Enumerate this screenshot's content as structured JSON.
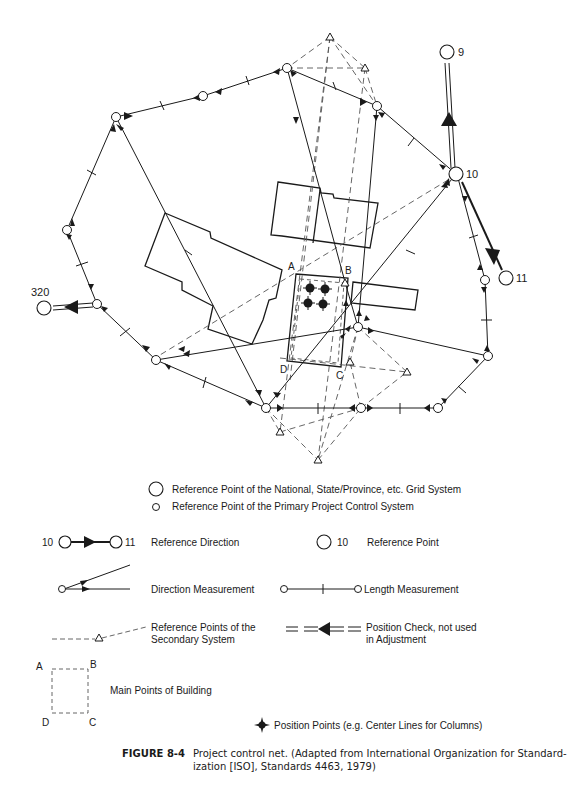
{
  "diagram": {
    "point_labels": {
      "p9": "9",
      "p10": "10",
      "p11": "11",
      "p320": "320",
      "A": "A",
      "B": "B",
      "C": "C",
      "D": "D"
    }
  },
  "legend": {
    "grid_point": "Reference Point of the National, State/Province, etc. Grid System",
    "primary_point": "Reference Point of the Primary Project Control System",
    "ref_direction": {
      "from": "10",
      "to": "11",
      "label": "Reference Direction"
    },
    "ref_point": {
      "num": "10",
      "label": "Reference Point"
    },
    "direction_measurement": "Direction Measurement",
    "length_measurement": "Length Measurement",
    "secondary_points": [
      "Reference Points of the",
      "Secondary System"
    ],
    "position_check": [
      "Position Check, not used",
      "in Adjustment"
    ],
    "main_points": {
      "a": "A",
      "b": "B",
      "c": "C",
      "d": "D",
      "label": "Main Points of Building"
    },
    "position_points": "Position Points (e.g. Center Lines for Columns)"
  },
  "caption": {
    "figure": "FIGURE 8-4",
    "line1": "Project control net. (Adapted from International Organization for Standard-",
    "line2": "ization [ISO], Standards 4463, 1979)"
  }
}
